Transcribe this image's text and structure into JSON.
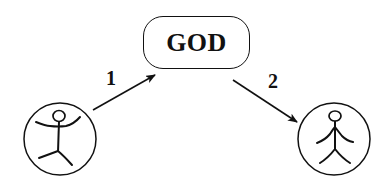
{
  "diagram": {
    "central_node": {
      "label": "GOD",
      "shape": "rounded-rectangle"
    },
    "edges": [
      {
        "label": "1",
        "from": "person-left",
        "to": "central_node",
        "direction": "upward"
      },
      {
        "label": "2",
        "from": "central_node",
        "to": "person-right",
        "direction": "downward"
      }
    ],
    "actors": [
      {
        "id": "person-left",
        "pose": "arms-raised",
        "shape": "circle"
      },
      {
        "id": "person-right",
        "pose": "arms-lowered",
        "shape": "circle"
      }
    ],
    "colors": {
      "stroke": "#111111",
      "background": "#ffffff"
    }
  }
}
